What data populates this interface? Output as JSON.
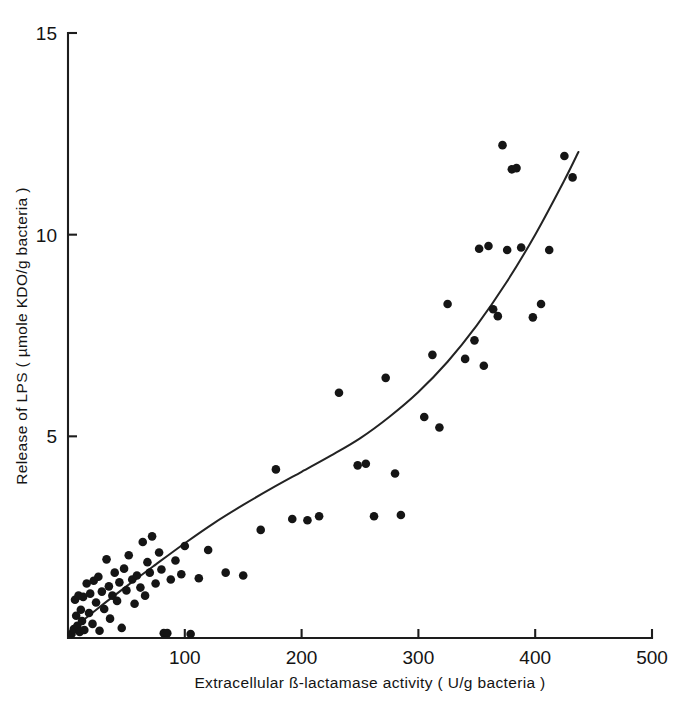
{
  "chart_data": {
    "type": "scatter",
    "title": "",
    "xlabel": "Extracellular ß-lactamase activity ( U/g bacteria )",
    "ylabel": "Release of LPS ( µmole KDO/g bacteria )",
    "xlim": [
      0,
      500
    ],
    "ylim": [
      0,
      15
    ],
    "xticks": [
      100,
      200,
      300,
      400,
      500
    ],
    "yticks": [
      5,
      10,
      15
    ],
    "xtick_labels": [
      "100",
      "200",
      "300",
      "400",
      "500"
    ],
    "ytick_labels": [
      "5",
      "10",
      "15"
    ],
    "grid": false,
    "legend": null,
    "marker": "filled-circle",
    "marker_color": "#151515",
    "curve_color": "#232323",
    "axis_color": "#1d1d1d",
    "series": [
      {
        "name": "Release of LPS vs extracellular ß-lactamase activity",
        "points": [
          [
            3,
            0.1
          ],
          [
            5,
            0.22
          ],
          [
            6,
            0.95
          ],
          [
            7,
            0.55
          ],
          [
            8,
            0.3
          ],
          [
            9,
            1.05
          ],
          [
            10,
            0.15
          ],
          [
            11,
            0.7
          ],
          [
            12,
            0.42
          ],
          [
            13,
            1.02
          ],
          [
            14,
            0.2
          ],
          [
            16,
            1.35
          ],
          [
            18,
            0.62
          ],
          [
            19,
            1.1
          ],
          [
            21,
            0.35
          ],
          [
            22,
            1.42
          ],
          [
            24,
            0.88
          ],
          [
            26,
            1.52
          ],
          [
            27,
            0.18
          ],
          [
            29,
            1.15
          ],
          [
            31,
            0.72
          ],
          [
            33,
            1.95
          ],
          [
            35,
            1.28
          ],
          [
            36,
            0.48
          ],
          [
            38,
            1.05
          ],
          [
            40,
            1.62
          ],
          [
            42,
            0.92
          ],
          [
            44,
            1.38
          ],
          [
            46,
            0.25
          ],
          [
            48,
            1.72
          ],
          [
            50,
            1.18
          ],
          [
            52,
            2.05
          ],
          [
            55,
            1.45
          ],
          [
            57,
            0.85
          ],
          [
            59,
            1.55
          ],
          [
            62,
            1.25
          ],
          [
            64,
            2.38
          ],
          [
            66,
            1.05
          ],
          [
            68,
            1.88
          ],
          [
            70,
            1.62
          ],
          [
            72,
            2.52
          ],
          [
            75,
            1.35
          ],
          [
            78,
            2.12
          ],
          [
            80,
            1.7
          ],
          [
            82,
            0.12
          ],
          [
            85,
            0.12
          ],
          [
            88,
            1.45
          ],
          [
            92,
            1.92
          ],
          [
            97,
            1.58
          ],
          [
            100,
            2.28
          ],
          [
            105,
            0.1
          ],
          [
            112,
            1.48
          ],
          [
            120,
            2.18
          ],
          [
            135,
            1.62
          ],
          [
            150,
            1.55
          ],
          [
            165,
            2.68
          ],
          [
            178,
            4.18
          ],
          [
            192,
            2.95
          ],
          [
            205,
            2.92
          ],
          [
            215,
            3.02
          ],
          [
            232,
            6.08
          ],
          [
            248,
            4.28
          ],
          [
            255,
            4.32
          ],
          [
            262,
            3.02
          ],
          [
            272,
            6.45
          ],
          [
            280,
            4.08
          ],
          [
            285,
            3.05
          ],
          [
            305,
            5.48
          ],
          [
            312,
            7.02
          ],
          [
            318,
            5.22
          ],
          [
            325,
            8.28
          ],
          [
            340,
            6.92
          ],
          [
            348,
            7.38
          ],
          [
            352,
            9.65
          ],
          [
            356,
            6.75
          ],
          [
            360,
            9.72
          ],
          [
            364,
            8.15
          ],
          [
            368,
            7.98
          ],
          [
            372,
            12.22
          ],
          [
            376,
            9.62
          ],
          [
            380,
            11.62
          ],
          [
            384,
            11.65
          ],
          [
            388,
            9.68
          ],
          [
            398,
            7.95
          ],
          [
            405,
            8.28
          ],
          [
            412,
            9.62
          ],
          [
            425,
            11.95
          ],
          [
            432,
            11.42
          ]
        ]
      }
    ],
    "fit_curve": {
      "name": "fitted trend line",
      "description": "monotonically increasing convex curve through the data",
      "points": [
        [
          2,
          0.18
        ],
        [
          25,
          0.72
        ],
        [
          50,
          1.28
        ],
        [
          75,
          1.82
        ],
        [
          100,
          2.35
        ],
        [
          125,
          2.85
        ],
        [
          150,
          3.3
        ],
        [
          175,
          3.72
        ],
        [
          200,
          4.12
        ],
        [
          225,
          4.52
        ],
        [
          250,
          4.95
        ],
        [
          275,
          5.48
        ],
        [
          300,
          6.1
        ],
        [
          325,
          6.85
        ],
        [
          350,
          7.75
        ],
        [
          375,
          8.8
        ],
        [
          400,
          10.0
        ],
        [
          425,
          11.35
        ],
        [
          437,
          12.05
        ]
      ]
    }
  }
}
